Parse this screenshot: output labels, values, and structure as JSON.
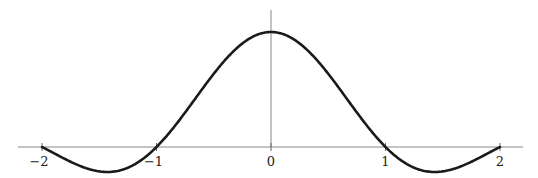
{
  "chart_data": {
    "type": "line",
    "title": "",
    "xlabel": "",
    "ylabel": "",
    "function": "sin(pi x)/(pi x)",
    "xlim": [
      -2,
      2
    ],
    "ylim": [
      -0.22,
      1.0
    ],
    "grid": false,
    "legend": null,
    "x_ticks": [
      -2,
      -1,
      0,
      1,
      2
    ],
    "x_tick_labels": [
      "−2",
      "−1",
      "0",
      "1",
      "2"
    ],
    "series": [
      {
        "name": "sinc",
        "x": [
          -2,
          -1.5,
          -1,
          -0.5,
          0,
          0.5,
          1,
          1.5,
          2
        ],
        "values": [
          0,
          -0.212,
          0,
          0.637,
          1,
          0.637,
          0,
          -0.212,
          0
        ]
      }
    ],
    "colors": {
      "curve": "#1a1a1a",
      "axis": "#888888"
    }
  }
}
